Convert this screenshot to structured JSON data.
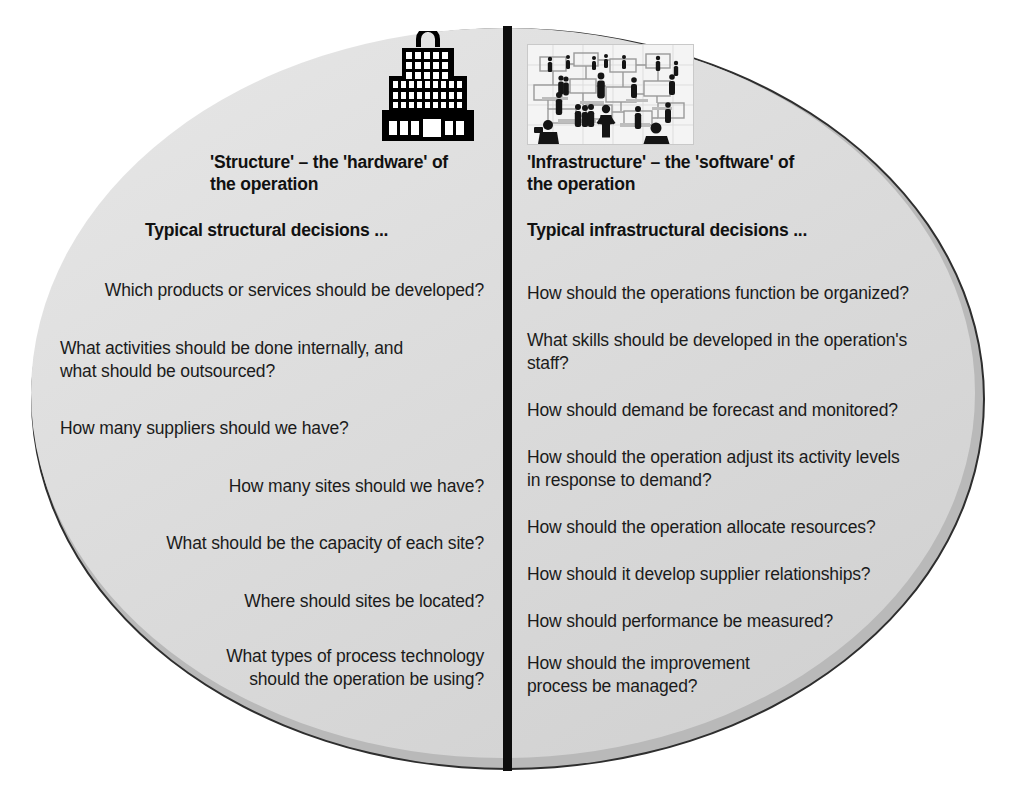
{
  "diagram": {
    "left": {
      "icon": "building-icon",
      "heading": "'Structure' – the 'hardware' of the operation",
      "heading_line1": "'Structure' – the 'hardware' of",
      "heading_line2": "the operation",
      "subheading": "Typical structural decisions ...",
      "questions": [
        "Which products or services should be developed?",
        "What activities should be done internally, and what should be outsourced?",
        "How many suppliers should we have?",
        "How many sites should we have?",
        "What should be the capacity of each site?",
        "Where should sites be located?",
        "What types of process technology should the operation be using?"
      ],
      "questions_lines": [
        [
          "Which products or services should be developed?"
        ],
        [
          "What activities should be done internally, and",
          "what should be outsourced?"
        ],
        [
          "How many suppliers should we have?"
        ],
        [
          "How many sites should we have?"
        ],
        [
          "What should be the capacity of each site?"
        ],
        [
          "Where should sites be located?"
        ],
        [
          "What types of process technology",
          "should the operation be using?"
        ]
      ]
    },
    "right": {
      "icon": "people-network-icon",
      "heading": "'Infrastructure' –  the 'software' of the operation",
      "heading_line1": "'Infrastructure' –  the 'software' of",
      "heading_line2": "the operation",
      "subheading": "Typical infrastructural decisions ...",
      "questions": [
        "How should the operations function be organized?",
        "What skills should be developed in the operation's staff?",
        "How should demand be forecast and monitored?",
        "How should the operation adjust its activity levels in response to demand?",
        "How should the operation allocate resources?",
        "How should it develop supplier relationships?",
        "How should performance be measured?",
        "How should the improvement process be managed?"
      ],
      "questions_lines": [
        [
          "How should the operations function be organized?"
        ],
        [
          "What skills should be developed in the operation's",
          "staff?"
        ],
        [
          "How should demand be forecast and monitored?"
        ],
        [
          "How should the operation adjust its activity levels",
          "in response to demand?"
        ],
        [
          "How should the operation allocate resources?"
        ],
        [
          "How should it develop supplier relationships?"
        ],
        [
          "How should performance be measured?"
        ],
        [
          "How should the improvement",
          "process be managed?"
        ]
      ]
    },
    "colors": {
      "ellipse_fill": "#dcdcdc",
      "ellipse_rim": "#b9b9b9",
      "ellipse_outline": "#2e2e2e",
      "divider": "#0d0d0d",
      "text": "#1b1b1b",
      "page_background": "#ffffff"
    }
  }
}
